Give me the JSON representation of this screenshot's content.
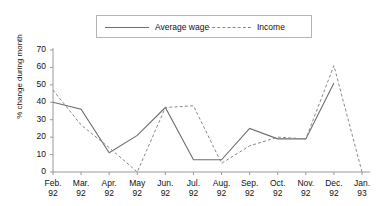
{
  "chart_data": {
    "type": "line",
    "title": "",
    "xlabel": "",
    "ylabel": "% change during month",
    "ylim": [
      0,
      70
    ],
    "yticks": [
      0,
      10,
      20,
      30,
      40,
      50,
      60,
      70
    ],
    "grid": false,
    "legend_position": "top-center",
    "categories": [
      "Feb. 92",
      "Mar. 92",
      "Apr. 92",
      "May 92",
      "Jun. 92",
      "Jul. 92",
      "Aug. 92",
      "Sep. 92",
      "Oct. 92",
      "Nov. 92",
      "Dec. 92",
      "Jan. 93"
    ],
    "category_lines": [
      [
        "Feb.",
        "92"
      ],
      [
        "Mar.",
        "92"
      ],
      [
        "Apr.",
        "92"
      ],
      [
        "May",
        "92"
      ],
      [
        "Jun.",
        "92"
      ],
      [
        "Jul.",
        "92"
      ],
      [
        "Aug.",
        "92"
      ],
      [
        "Sep.",
        "92"
      ],
      [
        "Oct.",
        "92"
      ],
      [
        "Nov.",
        "92"
      ],
      [
        "Dec.",
        "92"
      ],
      [
        "Jan.",
        "93"
      ]
    ],
    "series": [
      {
        "name": "Average wage",
        "style": "solid",
        "color": "#6e6e6e",
        "values": [
          40,
          36,
          11,
          21,
          37,
          7,
          7,
          25,
          19,
          19,
          51,
          null
        ]
      },
      {
        "name": "Income",
        "style": "dashed",
        "color": "#8a8a8a",
        "values": [
          47,
          27,
          14,
          0,
          37,
          38,
          5,
          15,
          20,
          19,
          61,
          0
        ]
      }
    ]
  },
  "axis": {
    "color": "#9a9a9a"
  }
}
